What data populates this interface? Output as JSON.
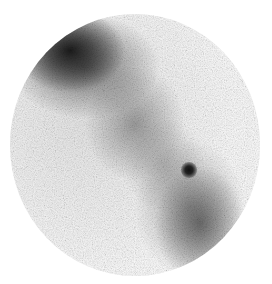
{
  "image": {
    "description": "Grayscale nuclear medicine scintigraphy image with circular field of view",
    "features": [
      {
        "name": "upper-left intense uptake region",
        "intensity": "high"
      },
      {
        "name": "diagonal band of uptake",
        "intensity": "medium"
      },
      {
        "name": "focal hotspot",
        "intensity": "high"
      },
      {
        "name": "lower-right uptake region",
        "intensity": "medium"
      }
    ],
    "colors": {
      "background": "#ffffff",
      "field": "#f4f4f4",
      "uptake_dark": "#111111"
    }
  }
}
